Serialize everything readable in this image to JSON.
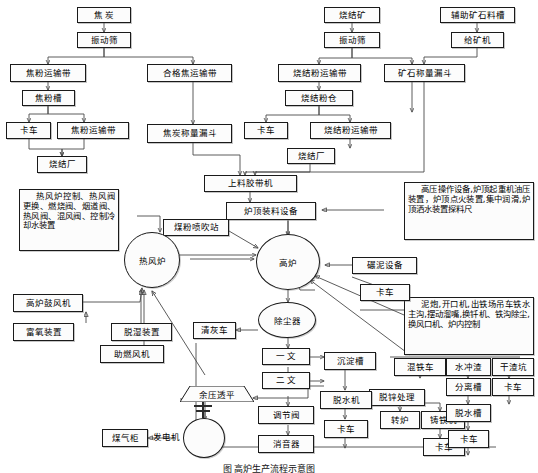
{
  "figure": {
    "caption": "图  高炉生产流程示意图",
    "type": "flowchart"
  },
  "nodes": {
    "coke_raw": "焦  炭",
    "coke_screen": "振动筛",
    "coke_powder_belt1": "焦粉运输带",
    "coke_powder_bin": "焦粉槽",
    "coke_truck": "卡车",
    "coke_powder_belt2": "焦粉运输带",
    "coke_sinter_plant": "烧结厂",
    "qualified_coke_belt": "合格焦运输带",
    "coke_weigh_hopper": "焦炭称量漏斗",
    "sinter_ore": "烧结矿",
    "sinter_screen": "振动筛",
    "sinter_powder_belt1": "烧结粉运输带",
    "sinter_powder_bin": "烧结粉仓",
    "sinter_truck": "卡车",
    "sinter_powder_belt2": "烧结粉运输带",
    "sinter_plant": "烧结厂",
    "aux_ore_trough": "辅助矿石料槽",
    "ore_feeder": "给矿机",
    "ore_weigh_hopper": "矿石称量漏斗",
    "charging_belt": "上料胶带机",
    "top_charging_equipment": "炉顶装料设备",
    "coal_injection": "煤粉喷吹站",
    "hot_blast_stove": "热风炉",
    "blast_furnace": "高炉",
    "dust_catcher": "除尘器",
    "ash_truck": "清灰车",
    "venturi1": "一  文",
    "venturi2": "二  文",
    "settling_tank": "沉淀槽",
    "dezinc": "脱锌处理",
    "dewater_machine": "脱水机",
    "dewater_truck": "卡车",
    "control_valve": "调节阀",
    "silencer": "消音器",
    "trt": "余压透平",
    "generator": "发电机",
    "gas_holder": "煤气柜",
    "bf_blower": "高炉鼓风机",
    "oxygen_device": "富氧装置",
    "dehumid_device": "脱湿装置",
    "combustion_fan": "助燃风机",
    "mud_equipment": "碾泥设备",
    "mud_truck": "卡车",
    "torpedo_car": "混铁车",
    "converter": "转炉",
    "casting_machine": "铸铁机",
    "casting_truck": "卡车",
    "water_slag": "水冲渣",
    "separation_tank": "分离槽",
    "dewater_tank": "脱水槽",
    "slag_truck": "卡车",
    "dry_slag_pit": "干渣坑",
    "dry_slag_truck": "卡车"
  },
  "annotations": {
    "stove_note": "热风炉控制、热风阀更换、燃烧阀、烟道阀、热风阀、混风阀、控制冷却水装置",
    "top_note": "高压操作设备,炉顶起重机油压装置，炉顶点火装置,集中润滑,炉顶洒水装置探料尺",
    "tap_note": "泥炮,开口机,出铁场吊车铁水主沟,摆动溜嘴,换钎机、铁沟除尘,换风口机、炉内控制"
  },
  "colors": {
    "line": "#4a4a4a",
    "border": "#1a1a1a",
    "fill": "#fcfcfc",
    "text": "#000000"
  }
}
